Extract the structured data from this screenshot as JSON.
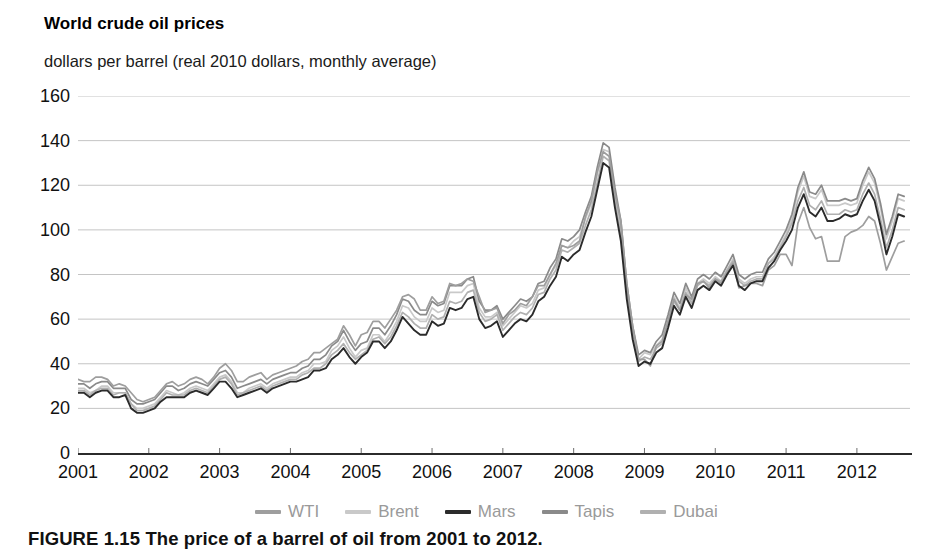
{
  "chart_data": {
    "type": "line",
    "title": "World crude oil prices",
    "subtitle": "dollars per barrel (real 2010 dollars, monthly average)",
    "xlabel": "",
    "ylabel": "dollars per barrel",
    "ylim": [
      0,
      160
    ],
    "ytick_values": [
      160,
      140,
      120,
      100,
      80,
      60,
      40,
      20,
      0
    ],
    "ytick_labels": [
      "160",
      "140",
      "120",
      "100",
      "80",
      "60",
      "40",
      "20",
      "0"
    ],
    "xtick_labels": [
      "2001",
      "2002",
      "2003",
      "2004",
      "2005",
      "2006",
      "2007",
      "2008",
      "2009",
      "2010",
      "2011",
      "2012"
    ],
    "xlim": [
      2001.0,
      2012.75
    ],
    "grid": true,
    "legend_position": "bottom",
    "x": [
      2001.0,
      2001.083,
      2001.167,
      2001.25,
      2001.333,
      2001.417,
      2001.5,
      2001.583,
      2001.667,
      2001.75,
      2001.833,
      2001.917,
      2002.0,
      2002.083,
      2002.167,
      2002.25,
      2002.333,
      2002.417,
      2002.5,
      2002.583,
      2002.667,
      2002.75,
      2002.833,
      2002.917,
      2003.0,
      2003.083,
      2003.167,
      2003.25,
      2003.333,
      2003.417,
      2003.5,
      2003.583,
      2003.667,
      2003.75,
      2003.833,
      2003.917,
      2004.0,
      2004.083,
      2004.167,
      2004.25,
      2004.333,
      2004.417,
      2004.5,
      2004.583,
      2004.667,
      2004.75,
      2004.833,
      2004.917,
      2005.0,
      2005.083,
      2005.167,
      2005.25,
      2005.333,
      2005.417,
      2005.5,
      2005.583,
      2005.667,
      2005.75,
      2005.833,
      2005.917,
      2006.0,
      2006.083,
      2006.167,
      2006.25,
      2006.333,
      2006.417,
      2006.5,
      2006.583,
      2006.667,
      2006.75,
      2006.833,
      2006.917,
      2007.0,
      2007.083,
      2007.167,
      2007.25,
      2007.333,
      2007.417,
      2007.5,
      2007.583,
      2007.667,
      2007.75,
      2007.833,
      2007.917,
      2008.0,
      2008.083,
      2008.167,
      2008.25,
      2008.333,
      2008.417,
      2008.5,
      2008.583,
      2008.667,
      2008.75,
      2008.833,
      2008.917,
      2009.0,
      2009.083,
      2009.167,
      2009.25,
      2009.333,
      2009.417,
      2009.5,
      2009.583,
      2009.667,
      2009.75,
      2009.833,
      2009.917,
      2010.0,
      2010.083,
      2010.167,
      2010.25,
      2010.333,
      2010.417,
      2010.5,
      2010.583,
      2010.667,
      2010.75,
      2010.833,
      2010.917,
      2011.0,
      2011.083,
      2011.167,
      2011.25,
      2011.333,
      2011.417,
      2011.5,
      2011.583,
      2011.667,
      2011.75,
      2011.833,
      2011.917,
      2012.0,
      2012.083,
      2012.167,
      2012.25,
      2012.333,
      2012.417,
      2012.5,
      2012.583,
      2012.667
    ],
    "series": [
      {
        "name": "WTI",
        "color": "#9e9e9e",
        "values": [
          33,
          32,
          32,
          34,
          34,
          33,
          30,
          31,
          30,
          27,
          24,
          23,
          24,
          25,
          28,
          31,
          32,
          30,
          31,
          33,
          34,
          33,
          31,
          34,
          38,
          40,
          37,
          32,
          32,
          34,
          35,
          36,
          33,
          35,
          36,
          37,
          38,
          39,
          41,
          42,
          45,
          45,
          47,
          49,
          51,
          57,
          53,
          48,
          53,
          54,
          59,
          59,
          56,
          60,
          64,
          70,
          71,
          69,
          64,
          64,
          70,
          67,
          68,
          76,
          75,
          76,
          78,
          77,
          70,
          63,
          64,
          65,
          58,
          62,
          64,
          67,
          66,
          70,
          75,
          75,
          80,
          85,
          93,
          92,
          93,
          95,
          106,
          113,
          126,
          135,
          133,
          116,
          104,
          76,
          57,
          42,
          42,
          39,
          48,
          50,
          59,
          69,
          64,
          71,
          69,
          76,
          77,
          74,
          78,
          76,
          81,
          85,
          74,
          75,
          76,
          76,
          75,
          82,
          84,
          89,
          89,
          84,
          103,
          110,
          101,
          96,
          97,
          86,
          86,
          86,
          97,
          99,
          100,
          102,
          106,
          104,
          94,
          82,
          88,
          94,
          95
        ]
      },
      {
        "name": "Brent",
        "color": "#c9c9c9",
        "values": [
          29,
          29,
          27,
          28,
          30,
          30,
          27,
          27,
          27,
          22,
          20,
          20,
          21,
          22,
          25,
          28,
          27,
          26,
          27,
          29,
          30,
          29,
          28,
          31,
          34,
          35,
          32,
          27,
          27,
          29,
          30,
          31,
          29,
          31,
          32,
          33,
          34,
          34,
          36,
          37,
          40,
          40,
          41,
          46,
          48,
          52,
          47,
          43,
          46,
          47,
          53,
          53,
          50,
          54,
          59,
          66,
          65,
          61,
          59,
          59,
          65,
          63,
          64,
          72,
          72,
          72,
          75,
          76,
          65,
          61,
          61,
          63,
          57,
          60,
          63,
          66,
          65,
          67,
          73,
          74,
          80,
          84,
          93,
          92,
          95,
          97,
          105,
          112,
          125,
          136,
          135,
          117,
          101,
          74,
          55,
          42,
          45,
          44,
          48,
          51,
          60,
          70,
          65,
          74,
          68,
          76,
          78,
          76,
          79,
          77,
          82,
          87,
          78,
          76,
          78,
          79,
          79,
          85,
          88,
          93,
          98,
          105,
          117,
          124,
          115,
          114,
          118,
          111,
          111,
          111,
          112,
          111,
          112,
          120,
          126,
          121,
          110,
          96,
          104,
          114,
          113
        ]
      },
      {
        "name": "Mars",
        "color": "#2b2b2b",
        "values": [
          27,
          27,
          25,
          27,
          28,
          28,
          25,
          25,
          26,
          20,
          18,
          18,
          19,
          20,
          23,
          25,
          25,
          25,
          25,
          27,
          28,
          27,
          26,
          29,
          32,
          32,
          29,
          25,
          26,
          27,
          28,
          29,
          27,
          29,
          30,
          31,
          32,
          32,
          33,
          34,
          37,
          37,
          38,
          42,
          44,
          47,
          43,
          40,
          43,
          45,
          50,
          50,
          47,
          50,
          55,
          61,
          58,
          55,
          53,
          53,
          59,
          57,
          58,
          65,
          64,
          65,
          69,
          70,
          60,
          56,
          57,
          59,
          52,
          55,
          58,
          60,
          59,
          62,
          68,
          70,
          75,
          79,
          88,
          86,
          89,
          91,
          99,
          106,
          118,
          130,
          128,
          110,
          95,
          69,
          51,
          39,
          41,
          40,
          45,
          47,
          56,
          66,
          62,
          70,
          65,
          73,
          75,
          73,
          77,
          75,
          80,
          84,
          75,
          73,
          76,
          77,
          77,
          83,
          86,
          91,
          95,
          100,
          110,
          116,
          108,
          106,
          110,
          104,
          104,
          105,
          107,
          106,
          107,
          113,
          118,
          113,
          102,
          89,
          97,
          107,
          106
        ]
      },
      {
        "name": "Tapis",
        "color": "#8a8a8a",
        "values": [
          31,
          31,
          29,
          31,
          32,
          32,
          29,
          29,
          29,
          24,
          22,
          22,
          23,
          24,
          27,
          30,
          30,
          28,
          29,
          31,
          32,
          31,
          30,
          33,
          36,
          37,
          34,
          29,
          30,
          31,
          32,
          33,
          31,
          33,
          34,
          35,
          36,
          36,
          38,
          39,
          42,
          42,
          44,
          48,
          50,
          55,
          50,
          46,
          49,
          50,
          56,
          56,
          53,
          57,
          62,
          69,
          68,
          64,
          62,
          62,
          68,
          66,
          67,
          75,
          75,
          75,
          78,
          79,
          68,
          64,
          64,
          66,
          60,
          63,
          66,
          69,
          68,
          70,
          76,
          77,
          83,
          87,
          96,
          95,
          97,
          100,
          108,
          115,
          128,
          139,
          137,
          119,
          104,
          76,
          57,
          44,
          46,
          45,
          50,
          53,
          62,
          72,
          67,
          76,
          70,
          78,
          80,
          78,
          81,
          79,
          84,
          89,
          80,
          78,
          80,
          81,
          81,
          87,
          90,
          95,
          100,
          107,
          119,
          126,
          117,
          116,
          120,
          113,
          113,
          113,
          114,
          113,
          114,
          122,
          128,
          123,
          112,
          98,
          106,
          116,
          115
        ]
      },
      {
        "name": "Dubai",
        "color": "#b0b0b0",
        "values": [
          28,
          28,
          26,
          28,
          29,
          29,
          26,
          27,
          27,
          22,
          19,
          19,
          20,
          21,
          24,
          27,
          26,
          26,
          26,
          28,
          29,
          28,
          27,
          30,
          33,
          34,
          31,
          26,
          27,
          28,
          29,
          30,
          28,
          30,
          31,
          32,
          33,
          33,
          35,
          36,
          38,
          38,
          40,
          44,
          46,
          49,
          45,
          42,
          44,
          46,
          51,
          52,
          49,
          52,
          57,
          63,
          61,
          58,
          56,
          56,
          62,
          60,
          61,
          68,
          67,
          68,
          72,
          73,
          63,
          59,
          60,
          62,
          55,
          58,
          61,
          63,
          62,
          65,
          71,
          72,
          78,
          82,
          91,
          90,
          92,
          94,
          102,
          109,
          121,
          133,
          131,
          113,
          98,
          71,
          53,
          41,
          43,
          42,
          47,
          49,
          58,
          68,
          64,
          72,
          67,
          75,
          77,
          75,
          78,
          77,
          82,
          86,
          77,
          75,
          77,
          78,
          78,
          85,
          87,
          92,
          97,
          103,
          113,
          119,
          111,
          109,
          113,
          107,
          107,
          107,
          109,
          108,
          109,
          116,
          121,
          116,
          105,
          92,
          100,
          110,
          109
        ]
      }
    ]
  },
  "legend": {
    "items": [
      {
        "label": "WTI"
      },
      {
        "label": "Brent"
      },
      {
        "label": "Mars"
      },
      {
        "label": "Tapis"
      },
      {
        "label": "Dubai"
      }
    ]
  },
  "figure": {
    "caption": "FIGURE 1.15  The price of a barrel of oil from 2001 to 2012."
  }
}
